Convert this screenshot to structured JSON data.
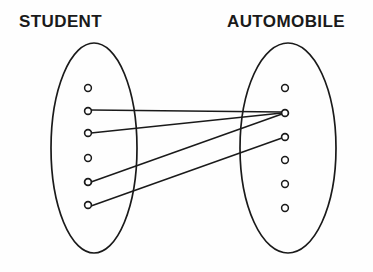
{
  "diagram": {
    "type": "set-mapping-diagram",
    "background_color": "#fefefe",
    "stroke_color": "#1a1a1a",
    "label_color": "#1a1a1a",
    "sets": [
      {
        "id": "student",
        "label": "STUDENT",
        "label_x": 19,
        "label_y": 13,
        "ellipse": {
          "cx": 94,
          "cy": 148,
          "rx": 43,
          "ry": 105
        },
        "members": [
          {
            "id": "s1",
            "cx": 88,
            "cy": 88,
            "r": 3.4
          },
          {
            "id": "s2",
            "cx": 88,
            "cy": 111,
            "r": 3.4
          },
          {
            "id": "s3",
            "cx": 88,
            "cy": 133,
            "r": 3.4
          },
          {
            "id": "s4",
            "cx": 88,
            "cy": 158,
            "r": 3.4
          },
          {
            "id": "s5",
            "cx": 88,
            "cy": 182,
            "r": 3.4
          },
          {
            "id": "s6",
            "cx": 88,
            "cy": 205,
            "r": 3.4
          }
        ]
      },
      {
        "id": "automobile",
        "label": "AUTOMOBILE",
        "label_x": 227,
        "label_y": 13,
        "ellipse": {
          "cx": 288,
          "cy": 148,
          "rx": 48,
          "ry": 105
        },
        "members": [
          {
            "id": "a1",
            "cx": 285,
            "cy": 88,
            "r": 3.4
          },
          {
            "id": "a2",
            "cx": 285,
            "cy": 113,
            "r": 3.4
          },
          {
            "id": "a3",
            "cx": 285,
            "cy": 137,
            "r": 3.4
          },
          {
            "id": "a4",
            "cx": 285,
            "cy": 160,
            "r": 3.4
          },
          {
            "id": "a5",
            "cx": 285,
            "cy": 184,
            "r": 3.4
          },
          {
            "id": "a6",
            "cx": 285,
            "cy": 208,
            "r": 3.4
          }
        ]
      }
    ],
    "connections": [
      {
        "id": "c1",
        "from": "s2",
        "to": "a2",
        "x1": 91,
        "y1": 110,
        "x2": 282,
        "y2": 112
      },
      {
        "id": "c2",
        "from": "s3",
        "to": "a2",
        "x1": 91,
        "y1": 133,
        "x2": 282,
        "y2": 113
      },
      {
        "id": "c3",
        "from": "s5",
        "to": "a2",
        "x1": 91,
        "y1": 182,
        "x2": 282,
        "y2": 114
      },
      {
        "id": "c4",
        "from": "s6",
        "to": "a3",
        "x1": 91,
        "y1": 206,
        "x2": 282,
        "y2": 138
      }
    ]
  }
}
